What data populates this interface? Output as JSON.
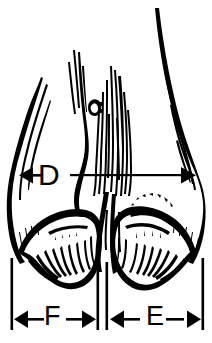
{
  "figure": {
    "background_color": "#ffffff",
    "ink_color": "#000000",
    "width_px": 212,
    "height_px": 343
  },
  "dimensions": [
    {
      "id": "D",
      "label": "D",
      "description": "overall width across the foot, double-headed horizontal arrow",
      "arrow_type": "double",
      "x_start": 20,
      "x_end": 196,
      "y": 175
    },
    {
      "id": "F",
      "label": "F",
      "description": "width of the left (lateral) claw, double-headed horizontal arrow",
      "arrow_type": "double",
      "x_start": 12,
      "x_end": 97,
      "y": 319
    },
    {
      "id": "E",
      "label": "E",
      "description": "width of the right (medial) claw, double-headed horizontal arrow",
      "arrow_type": "double",
      "x_start": 108,
      "x_end": 202,
      "y": 319
    }
  ],
  "extension_lines": [
    {
      "id": "left-outer",
      "x": 12,
      "y_top": 258,
      "y_bottom": 330
    },
    {
      "id": "mid-left",
      "x": 98,
      "y_top": 262,
      "y_bottom": 330
    },
    {
      "id": "mid-right",
      "x": 107,
      "y_top": 262,
      "y_bottom": 330
    },
    {
      "id": "right-outer",
      "x": 203,
      "y_top": 258,
      "y_bottom": 330
    }
  ]
}
